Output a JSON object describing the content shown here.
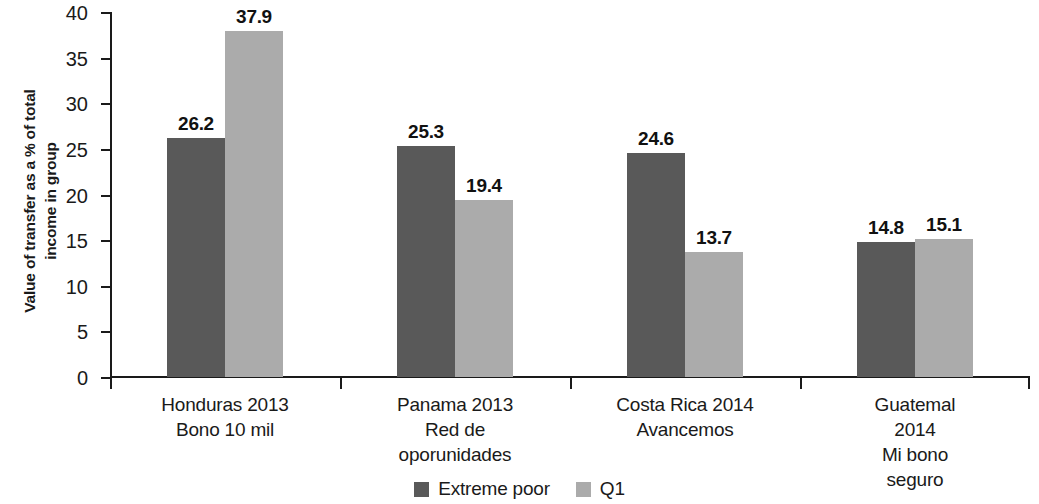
{
  "chart_data": {
    "type": "bar",
    "title": "",
    "xlabel": "",
    "ylabel": "Value of transfer as a % of total\nincome in group",
    "ylim": [
      0,
      40
    ],
    "ytick_step": 5,
    "yticks": [
      "0",
      "5",
      "10",
      "15",
      "20",
      "25",
      "30",
      "35",
      "40"
    ],
    "grid": false,
    "legend_position": "bottom-center",
    "categories": [
      "Honduras 2013\nBono 10 mil",
      "Panama 2013\nRed de\noporunidades",
      "Costa Rica 2014\nAvancemos",
      "Guatemal 2014\nMi bono seguro"
    ],
    "series": [
      {
        "name": "Extreme poor",
        "color": "#595959",
        "values": [
          26.2,
          25.3,
          24.6,
          14.8
        ],
        "labels": [
          "26.2",
          "25.3",
          "24.6",
          "14.8"
        ]
      },
      {
        "name": "Q1",
        "color": "#ababab",
        "values": [
          37.9,
          19.4,
          13.7,
          15.1
        ],
        "labels": [
          "37.9",
          "19.4",
          "13.7",
          "15.1"
        ]
      }
    ]
  },
  "legend": {
    "items": [
      {
        "label": "Extreme poor",
        "swatch": "dark"
      },
      {
        "label": "Q1",
        "swatch": "light"
      }
    ]
  }
}
